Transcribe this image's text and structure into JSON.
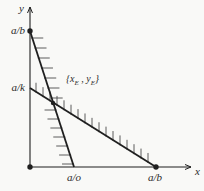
{
  "figure": {
    "background": "#f9f9f7",
    "ink": "#1f1f1f",
    "hatch_color": "#4a4a4a",
    "axes": {
      "y_label": "y",
      "x_label": "x",
      "origin": [
        30,
        167
      ],
      "y_top": 7,
      "x_right": 191
    },
    "tick_labels": {
      "y_upper": "a/b",
      "y_lower": "a/k",
      "x_left": "a/o",
      "x_right": "a/b"
    },
    "equilibrium_label": {
      "pre": "{x",
      "sub1": "E",
      "mid": " , y",
      "sub2": "E",
      "post": "}"
    },
    "lines": {
      "steep": {
        "from": [
          30,
          31
        ],
        "to": [
          74,
          167
        ],
        "hatch_len": 11,
        "hatch_gap": 10
      },
      "flat": {
        "from": [
          30,
          88
        ],
        "to": [
          156,
          167
        ],
        "hatch_len": 9,
        "hatch_gap": 7
      }
    },
    "equilibrium_point": [
      53,
      103
    ],
    "dots": [
      [
        30,
        31
      ],
      [
        30,
        167
      ],
      [
        156,
        167
      ]
    ]
  }
}
